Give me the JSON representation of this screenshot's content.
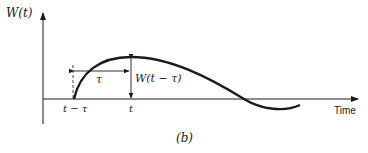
{
  "figure": {
    "y_axis_label": "W(t)",
    "x_axis_label": "Time",
    "tick_labels": [
      "t − τ",
      "t"
    ],
    "interval_label": "τ",
    "value_label": "W(t − τ)",
    "caption": "(b)"
  },
  "colors": {
    "line": "#1a1a1a",
    "background": "#ffffff"
  }
}
